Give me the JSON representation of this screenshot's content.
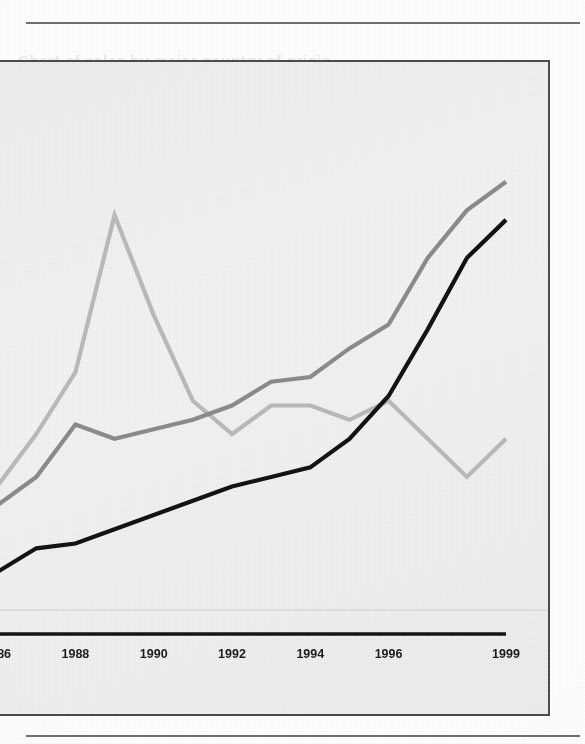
{
  "page": {
    "background_color": "#fdfdfd",
    "panel_color": "#f1f1f1",
    "rule_color": "#6f7175",
    "bleed_text": "Chart of sales by major country of origin"
  },
  "chart_data": {
    "type": "line",
    "title": "",
    "subtitle": "",
    "xlabel": "",
    "ylabel": "",
    "grid": false,
    "legend_position": "none",
    "x": [
      1985,
      1986,
      1987,
      1988,
      1989,
      1990,
      1991,
      1992,
      1993,
      1994,
      1995,
      1996,
      1997,
      1998,
      1999
    ],
    "tick_labels": [
      "1986",
      "1988",
      "1990",
      "1992",
      "1994",
      "1996",
      "1999"
    ],
    "tick_values": [
      1986,
      1988,
      1990,
      1992,
      1994,
      1996,
      1999
    ],
    "xlim": [
      1985,
      1999
    ],
    "ylim": [
      0,
      100
    ],
    "series": [
      {
        "name": "light-gray-series",
        "color": "#b9b9b9",
        "values": [
          22,
          31,
          42,
          55,
          88,
          67,
          49,
          42,
          48,
          48,
          45,
          49,
          41,
          33,
          41
        ]
      },
      {
        "name": "medium-gray-series",
        "color": "#8b8b8b",
        "values": [
          21,
          27,
          33,
          44,
          41,
          43,
          45,
          48,
          53,
          54,
          60,
          65,
          79,
          89,
          95
        ]
      },
      {
        "name": "black-series",
        "color": "#131313",
        "values": [
          10,
          13,
          18,
          19,
          22,
          25,
          28,
          31,
          33,
          35,
          41,
          50,
          64,
          79,
          87
        ]
      }
    ]
  },
  "axis": {
    "baseline_color": "#141414",
    "gridline_color": "#d8d8d8"
  }
}
